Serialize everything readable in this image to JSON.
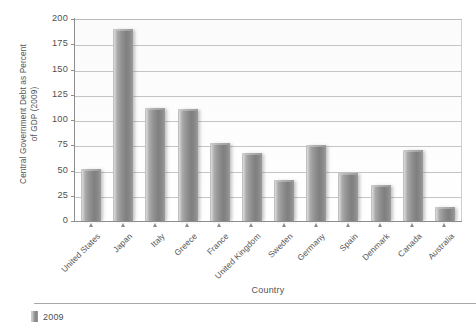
{
  "chart_data": {
    "type": "bar",
    "title": "",
    "subtitle": "",
    "xlabel": "Country",
    "ylabel": "Central Government Debt as Percent\nof GDP (2009)",
    "ylabel_lines": [
      "Central Government Debt as Percent",
      "of GDP (2009)"
    ],
    "ylim": [
      0,
      200
    ],
    "yticks": [
      0,
      25,
      50,
      75,
      100,
      125,
      150,
      175,
      200
    ],
    "ytick_labels": [
      "0",
      "25",
      "50",
      "75",
      "100",
      "125",
      "150",
      "175",
      "200"
    ],
    "grid": "horizontal",
    "legend_position": "bottom-left",
    "legend": [
      "2009"
    ],
    "categories": [
      "United States",
      "Japan",
      "Italy",
      "Greece",
      "France",
      "United Kingdom",
      "Sweden",
      "Germany",
      "Spain",
      "Denmark",
      "Canada",
      "Australia"
    ],
    "series": [
      {
        "name": "2009",
        "color": "#8f8f8f",
        "values": [
          52,
          191,
          113,
          112,
          78,
          68,
          42,
          76,
          49,
          37,
          71,
          15
        ]
      }
    ]
  },
  "legend": {
    "entry_label": "2009",
    "swatch_name": "bar-swatch"
  },
  "axes": {
    "x_title": "Country",
    "y_title_line1": "Central Government Debt as Percent",
    "y_title_line2": "of GDP (2009)"
  },
  "colors": {
    "bar_light": "#d6d6d6",
    "bar_mid": "#9c9c9c",
    "bar_dark": "#7f7f7f",
    "gridline": "#c4c4c4",
    "axis": "#8d8d8d",
    "text": "#555555",
    "plot_background": "#fdfdfd",
    "page_background": "#ffffff"
  }
}
